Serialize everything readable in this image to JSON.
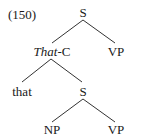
{
  "figure": {
    "example_number": "(150)",
    "nodes": {
      "root_s": "S",
      "that_c_italic": "That",
      "that_c_suffix": "-C",
      "top_vp": "VP",
      "that_word": "that",
      "embedded_s": "S",
      "np": "NP",
      "bottom_vp": "VP"
    },
    "edges": [
      {
        "from": "S",
        "to": "That-C"
      },
      {
        "from": "S",
        "to": "VP"
      },
      {
        "from": "That-C",
        "to": "that"
      },
      {
        "from": "That-C",
        "to": "S"
      },
      {
        "from": "S",
        "to": "NP"
      },
      {
        "from": "S",
        "to": "VP"
      }
    ],
    "colors": {
      "text": "#1a1a1a",
      "lines": "#333333",
      "background": "#ffffff"
    }
  }
}
